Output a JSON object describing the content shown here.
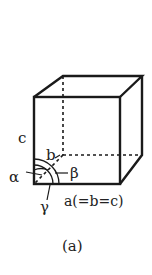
{
  "figure": {
    "caption": "(a)",
    "type": "unit cell",
    "labels": {
      "edge_c": "c",
      "edge_b": "b",
      "alpha": "α",
      "beta": "β",
      "gamma": "γ",
      "edge_a": "a(=b=c)"
    },
    "colors": {
      "stroke": "#1a1a1a",
      "background": "#ffffff"
    }
  }
}
